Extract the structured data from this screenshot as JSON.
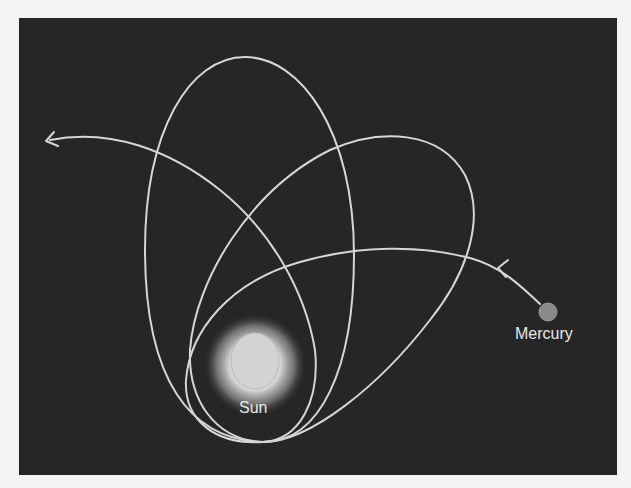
{
  "figure": {
    "background_color": "#262626",
    "page_color": "#f4f4f4",
    "line_color": "#d6d6d6"
  },
  "bodies": {
    "sun": {
      "label": "Sun",
      "cx": 255,
      "cy": 361,
      "core_radius": 25,
      "glow_radius": 48
    },
    "mercury": {
      "label": "Mercury",
      "cx": 548,
      "cy": 312,
      "radius": 9,
      "color": "#8a8a8a"
    }
  },
  "orbit_paths": [
    {
      "name": "incoming-trajectory",
      "d": "M 540 304 C 520 285, 500 266, 470 258 C 420 245, 360 245, 300 262 C 230 282, 190 330, 186 380 C 184 420, 215 445, 263 442"
    },
    {
      "name": "tall-ellipse",
      "d": "M 263 442 C 190 440, 145 380, 145 250 C 145 130, 190 57, 245 57 C 300 57, 354 130, 354 255 C 354 370, 320 442, 263 442"
    },
    {
      "name": "tilted-ellipse",
      "d": "M 263 442 C 215 440, 188 400, 190 350 C 195 280, 250 190, 330 150 C 380 128, 440 130, 465 175 C 485 215, 470 270, 430 320 C 380 385, 310 442, 263 442"
    },
    {
      "name": "outgoing-arc",
      "d": "M 263 442 C 300 440, 320 400, 315 350 C 305 290, 270 230, 220 190 C 170 150, 110 128, 50 140"
    }
  ],
  "arrows": [
    {
      "name": "exit-arrowhead",
      "points": "46,141 54,132 M46,141 58,146"
    },
    {
      "name": "approach-arrowhead",
      "points": "498,268 508,260 M498,268 506,277"
    }
  ]
}
